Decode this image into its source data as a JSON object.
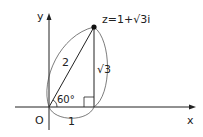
{
  "diagram": {
    "axis_x_label": "x",
    "axis_y_label": "y",
    "origin_label": "O",
    "point_label_prefix": "z=1+",
    "point_label_sqrt": "√3",
    "point_label_suffix": "i",
    "hypotenuse_label": "2",
    "vertical_label": "√3",
    "base_label": "1",
    "angle_label": "60°",
    "colors": {
      "line": "#222222"
    }
  }
}
